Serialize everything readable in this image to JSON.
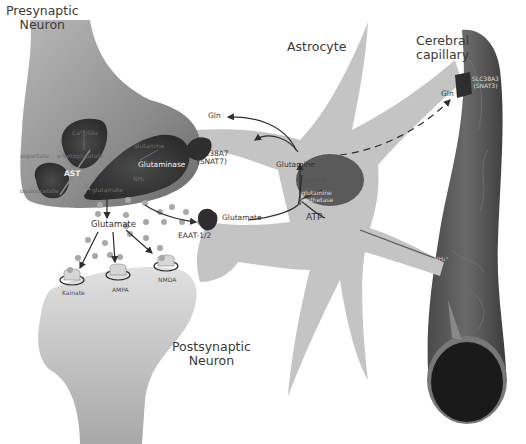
{
  "diagram": {
    "cells": {
      "presynaptic": "Presynaptic\nNeuron",
      "postsynaptic": "Postsynaptic\nNeuron",
      "astrocyte": "Astrocyte",
      "capillary": "Cerebral\ncapillary"
    },
    "presynaptic_labels": {
      "mito_top": "Ca²⁺/Glu",
      "aspartate": "aspartate",
      "alpha_kg": "α-ketoglutarate",
      "ast": "AST",
      "oxaloacetate": "oxaloacetate",
      "glutamate_inner": "glutamate",
      "glutamine_inner": "glutamine",
      "glutaminase": "Glutaminase",
      "nh3": "NH₃"
    },
    "synapse_labels": {
      "glutamate": "Glutamate",
      "kainate": "Kainate",
      "ampa": "AMPA",
      "nmda": "NMDA"
    },
    "transporters": {
      "snat7_line1": "SLC38A7",
      "snat7_line2": "(SNAT7)",
      "eaat": "EAAT-1/2",
      "snat3_line1": "SLC38A3",
      "snat3_line2": "(SNAT3)"
    },
    "astrocyte_labels": {
      "gln_left": "Gln",
      "glutamine": "Glutamine",
      "adp_pi": "ADP+Pi",
      "gs_line1": "glutamine",
      "gs_line2": "synthetase",
      "atp": "ATP",
      "glutamate": "Glutamate",
      "gln_right": "Gln",
      "nh4": "NH₄⁺"
    },
    "colors": {
      "presynaptic_body": "#8a8a8a",
      "mitochondria": "#3c3c3c",
      "astrocyte": "#c4c4c4",
      "postsynaptic": "#bdbdbd",
      "capillary": "#555555",
      "capillary_lumen": "#1a1a1a",
      "glutamate_dots": "#a8a8a8",
      "transporter": "#2e2e2e"
    }
  }
}
